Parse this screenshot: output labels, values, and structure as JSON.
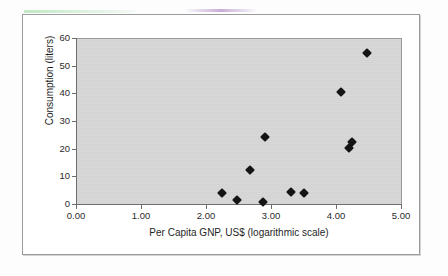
{
  "figure": {
    "background_color": "#ffffff",
    "plot_background_color": "#d6d6d6",
    "border_color": "#9b9b9b",
    "marker_color": "#141414"
  },
  "chart_data": {
    "type": "scatter",
    "title": "",
    "xlabel": "Per Capita GNP, US$ (logarithmic scale)",
    "ylabel": "Consumption (liters)",
    "xlim": [
      0.0,
      5.0
    ],
    "ylim": [
      0,
      60
    ],
    "xticks": [
      "0.00",
      "1.00",
      "2.00",
      "3.00",
      "4.00",
      "5.00"
    ],
    "xtick_values": [
      0.0,
      1.0,
      2.0,
      3.0,
      4.0,
      5.0
    ],
    "yticks": [
      "0",
      "10",
      "20",
      "30",
      "40",
      "50",
      "60"
    ],
    "ytick_values": [
      0,
      10,
      20,
      30,
      40,
      50,
      60
    ],
    "grid": false,
    "legend": null,
    "marker_shape": "diamond",
    "points": [
      {
        "x": 2.25,
        "y": 4.0
      },
      {
        "x": 2.48,
        "y": 1.5
      },
      {
        "x": 2.68,
        "y": 12.2
      },
      {
        "x": 2.88,
        "y": 0.8
      },
      {
        "x": 2.9,
        "y": 24.4
      },
      {
        "x": 3.31,
        "y": 4.5
      },
      {
        "x": 3.5,
        "y": 4.1
      },
      {
        "x": 4.07,
        "y": 40.5
      },
      {
        "x": 4.2,
        "y": 20.3
      },
      {
        "x": 4.25,
        "y": 22.5
      },
      {
        "x": 4.48,
        "y": 54.5
      }
    ]
  }
}
